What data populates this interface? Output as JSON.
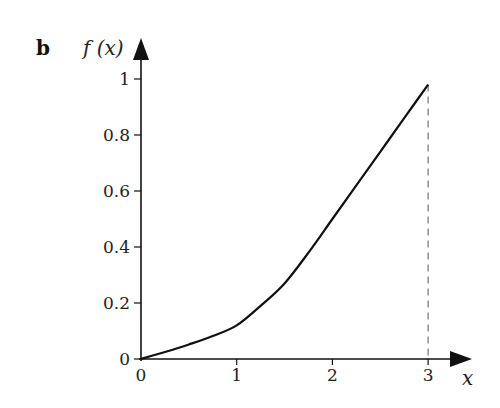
{
  "panel_label": "b",
  "chart_data": {
    "type": "line",
    "title": "",
    "xlabel": "x",
    "ylabel": "f (x)",
    "xlim": [
      0,
      3.4
    ],
    "ylim": [
      0,
      1.05
    ],
    "grid": false,
    "legend": null,
    "x_ticks": [
      "0",
      "1",
      "2",
      "3"
    ],
    "y_ticks": [
      "0",
      "0.2",
      "0.4",
      "0.6",
      "0.8",
      "1"
    ],
    "series": [
      {
        "name": "f(x)",
        "x": [
          0,
          0.25,
          0.5,
          0.75,
          1.0,
          1.25,
          1.5,
          1.75,
          2.0,
          2.25,
          2.5,
          2.75,
          3.0
        ],
        "y": [
          0,
          0.025,
          0.052,
          0.082,
          0.12,
          0.19,
          0.27,
          0.38,
          0.5,
          0.62,
          0.74,
          0.86,
          0.98
        ]
      }
    ],
    "annotations": [
      {
        "type": "dashed-vertical-line",
        "x": 3,
        "from_y": 0,
        "to_y": 0.98
      }
    ]
  }
}
